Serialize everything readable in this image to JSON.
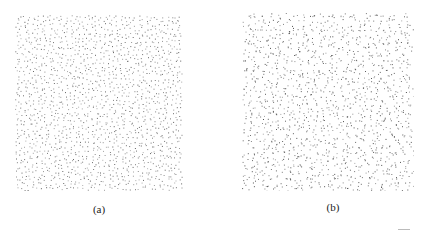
{
  "figure": {
    "panels": [
      {
        "id": "a",
        "caption": "(a)",
        "description": "Blue-noise (Poisson-disk-like) point distribution, evenly spaced dots",
        "dot_color": "#555555"
      },
      {
        "id": "b",
        "caption": "(b)",
        "description": "Point distribution with more irregular spacing and clustering",
        "dot_color": "#444444"
      }
    ]
  }
}
